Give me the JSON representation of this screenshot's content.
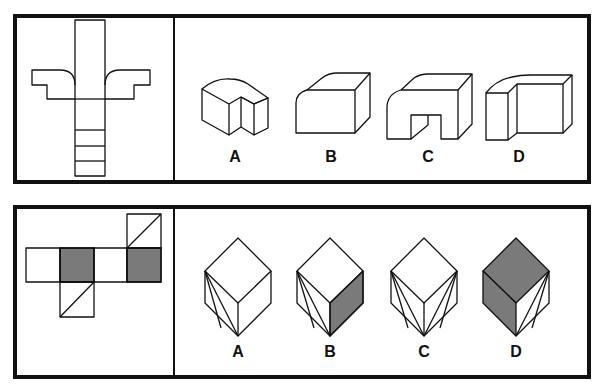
{
  "puzzles": [
    {
      "id": "puzzle-1",
      "prompt_figure": "unfolded-net-cross-shape",
      "options": [
        {
          "label": "A",
          "figure": "l-shaped-block-with-notch"
        },
        {
          "label": "B",
          "figure": "block-with-rounded-front-edge"
        },
        {
          "label": "C",
          "figure": "arch-block-with-rounded-corner"
        },
        {
          "label": "D",
          "figure": "l-shaped-block-rounded-top"
        }
      ]
    },
    {
      "id": "puzzle-2",
      "prompt_figure": "cube-net-with-shaded-and-diagonal-faces",
      "options": [
        {
          "label": "A",
          "figure": "cube-left-face-diagonal"
        },
        {
          "label": "B",
          "figure": "cube-left-diagonal-right-shaded"
        },
        {
          "label": "C",
          "figure": "cube-both-faces-diagonal"
        },
        {
          "label": "D",
          "figure": "cube-top-left-shaded-right-diagonal"
        }
      ]
    }
  ],
  "colors": {
    "line": "#111111",
    "shade": "#7a7a7a",
    "background": "#ffffff"
  }
}
